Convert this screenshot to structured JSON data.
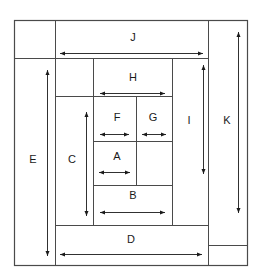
{
  "diagram": {
    "kind": "nested-rectangle-dimension-diagram",
    "title": "",
    "background_color": "#ffffff",
    "line_color": "#4a4a4a",
    "arrow_color": "#1a1a1a",
    "label_color": "#1a1a1a",
    "canvas": {
      "width": 261,
      "height": 280
    },
    "outer_border": {
      "x": 14,
      "y": 20,
      "width": 233,
      "height": 245
    },
    "labels": [
      {
        "id": "A",
        "text": "A",
        "x": 117,
        "y": 157,
        "orientation": "horizontal"
      },
      {
        "id": "B",
        "text": "B",
        "x": 133,
        "y": 196,
        "orientation": "horizontal"
      },
      {
        "id": "C",
        "text": "C",
        "x": 72,
        "y": 160,
        "orientation": "horizontal"
      },
      {
        "id": "D",
        "text": "D",
        "x": 131,
        "y": 240,
        "orientation": "horizontal"
      },
      {
        "id": "E",
        "text": "E",
        "x": 33,
        "y": 160,
        "orientation": "horizontal"
      },
      {
        "id": "F",
        "text": "F",
        "x": 117,
        "y": 118,
        "orientation": "horizontal"
      },
      {
        "id": "G",
        "text": "G",
        "x": 153,
        "y": 118,
        "orientation": "horizontal"
      },
      {
        "id": "H",
        "text": "H",
        "x": 133,
        "y": 78,
        "orientation": "horizontal"
      },
      {
        "id": "I",
        "text": "I",
        "x": 189,
        "y": 121,
        "orientation": "horizontal"
      },
      {
        "id": "J",
        "text": "J",
        "x": 133,
        "y": 38,
        "orientation": "horizontal"
      },
      {
        "id": "K",
        "text": "K",
        "x": 227,
        "y": 121,
        "orientation": "horizontal"
      }
    ],
    "rectangles": [
      {
        "id": "outer",
        "x": 14,
        "y": 20,
        "width": 233,
        "height": 245
      },
      {
        "id": "J-band",
        "x": 55,
        "y": 20,
        "width": 153,
        "height": 38
      },
      {
        "id": "K-band",
        "x": 208,
        "y": 20,
        "width": 39,
        "height": 225
      },
      {
        "id": "E-band",
        "x": 14,
        "y": 58,
        "width": 41,
        "height": 207
      },
      {
        "id": "D-band",
        "x": 55,
        "y": 225,
        "width": 153,
        "height": 40
      },
      {
        "id": "I-band",
        "x": 172,
        "y": 58,
        "width": 36,
        "height": 167
      },
      {
        "id": "C-band",
        "x": 55,
        "y": 96,
        "width": 38,
        "height": 129
      },
      {
        "id": "H-band",
        "x": 93,
        "y": 58,
        "width": 79,
        "height": 38
      },
      {
        "id": "B-band",
        "x": 93,
        "y": 185,
        "width": 79,
        "height": 40
      },
      {
        "id": "F-cell",
        "x": 93,
        "y": 96,
        "width": 43,
        "height": 45
      },
      {
        "id": "G-cell",
        "x": 136,
        "y": 96,
        "width": 36,
        "height": 45
      },
      {
        "id": "A-cell",
        "x": 93,
        "y": 141,
        "width": 43,
        "height": 44
      },
      {
        "id": "inner-fill",
        "x": 136,
        "y": 141,
        "width": 36,
        "height": 44
      }
    ],
    "dimension_arrows": [
      {
        "id": "A-arrow",
        "label": "A",
        "orientation": "horizontal",
        "x1": 99,
        "x2": 130,
        "y": 172
      },
      {
        "id": "B-arrow",
        "label": "B",
        "orientation": "horizontal",
        "x1": 100,
        "x2": 165,
        "y": 212
      },
      {
        "id": "C-arrow",
        "label": "C",
        "orientation": "vertical",
        "y1": 112,
        "y2": 216,
        "x": 86
      },
      {
        "id": "D-arrow",
        "label": "D",
        "orientation": "horizontal",
        "x1": 60,
        "x2": 202,
        "y": 254
      },
      {
        "id": "E-arrow",
        "label": "E",
        "orientation": "vertical",
        "y1": 70,
        "y2": 256,
        "x": 47
      },
      {
        "id": "F-arrow",
        "label": "F",
        "orientation": "horizontal",
        "x1": 100,
        "x2": 129,
        "y": 134
      },
      {
        "id": "G-arrow",
        "label": "G",
        "orientation": "horizontal",
        "x1": 142,
        "x2": 166,
        "y": 134
      },
      {
        "id": "H-arrow",
        "label": "H",
        "orientation": "horizontal",
        "x1": 100,
        "x2": 165,
        "y": 93
      },
      {
        "id": "I-arrow",
        "label": "I",
        "orientation": "vertical",
        "y1": 65,
        "y2": 174,
        "x": 203
      },
      {
        "id": "J-arrow",
        "label": "J",
        "orientation": "horizontal",
        "x1": 60,
        "x2": 203,
        "y": 53
      },
      {
        "id": "K-arrow",
        "label": "K",
        "orientation": "vertical",
        "y1": 32,
        "y2": 213,
        "x": 238
      }
    ]
  }
}
